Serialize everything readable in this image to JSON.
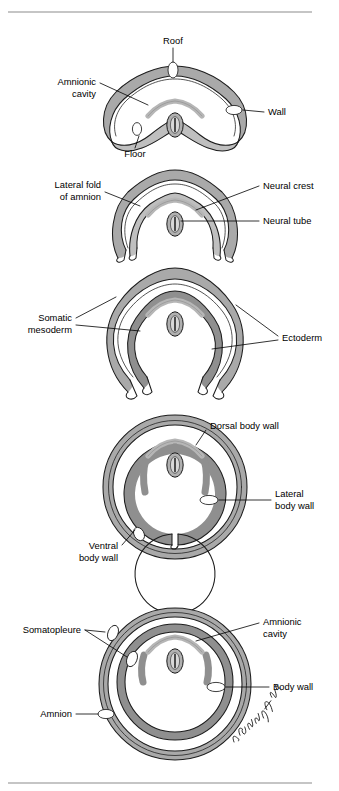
{
  "figure": {
    "rules": {
      "top_y": 12,
      "bottom_y": 783
    },
    "signature": "A. Cunningham '94",
    "palette": {
      "band_gray": "#a9a9a9",
      "band_gray_light": "#bfbfbf",
      "band_dark": "#8f8f8f",
      "outline": "#1c1c1c",
      "cavity": "#ffffff",
      "rule": "#8c8c8c",
      "background": "#ffffff"
    }
  },
  "panels": [
    {
      "id": "panel-1",
      "stage": 1,
      "labels": [
        {
          "id": "roof",
          "text": "Roof",
          "lines": [
            "Roof"
          ],
          "align": "middle",
          "x": 173,
          "y": 44
        },
        {
          "id": "amnionic-cavity",
          "text": "Amnionic cavity",
          "lines": [
            "Amnionic",
            "cavity"
          ],
          "align": "end",
          "x": 96,
          "y": 85
        },
        {
          "id": "wall",
          "text": "Wall",
          "lines": [
            "Wall"
          ],
          "align": "start",
          "x": 268,
          "y": 115
        },
        {
          "id": "floor",
          "text": "Floor",
          "lines": [
            "Floor"
          ],
          "align": "middle",
          "x": 135,
          "y": 155
        }
      ]
    },
    {
      "id": "panel-2",
      "stage": 2,
      "labels": [
        {
          "id": "lateral-fold-of-amnion",
          "text": "Lateral fold of amnion",
          "lines": [
            "Lateral fold",
            "of amnion"
          ],
          "align": "end",
          "x": 101,
          "y": 188
        },
        {
          "id": "neural-crest",
          "text": "Neural crest",
          "lines": [
            "Neural crest"
          ],
          "align": "start",
          "x": 263,
          "y": 188
        },
        {
          "id": "neural-tube",
          "text": "Neural tube",
          "lines": [
            "Neural tube"
          ],
          "align": "start",
          "x": 263,
          "y": 224
        }
      ]
    },
    {
      "id": "panel-3",
      "stage": 3,
      "labels": [
        {
          "id": "somatic-mesoderm",
          "text": "Somatic mesoderm",
          "lines": [
            "Somatic",
            "mesoderm"
          ],
          "align": "end",
          "x": 72,
          "y": 321
        },
        {
          "id": "ectoderm",
          "text": "Ectoderm",
          "lines": [
            "Ectoderm"
          ],
          "align": "start",
          "x": 282,
          "y": 338
        }
      ]
    },
    {
      "id": "panel-4",
      "stage": 4,
      "labels": [
        {
          "id": "dorsal-body-wall",
          "text": "Dorsal body wall",
          "lines": [
            "Dorsal body wall"
          ],
          "align": "start",
          "x": 210,
          "y": 429
        },
        {
          "id": "lateral-body-wall",
          "text": "Lateral body wall",
          "lines": [
            "Lateral",
            "body wall"
          ],
          "align": "start",
          "x": 275,
          "y": 502
        },
        {
          "id": "ventral-body-wall",
          "text": "Ventral body wall",
          "lines": [
            "Ventral",
            "body wall"
          ],
          "align": "end",
          "x": 118,
          "y": 549
        }
      ]
    },
    {
      "id": "panel-5",
      "stage": 5,
      "labels": [
        {
          "id": "somatopleure",
          "text": "Somatopleure",
          "lines": [
            "Somatopleure"
          ],
          "align": "end",
          "x": 81,
          "y": 632
        },
        {
          "id": "amnionic-cavity-2",
          "text": "Amnionic cavity",
          "lines": [
            "Amnionic",
            "cavity"
          ],
          "align": "start",
          "x": 263,
          "y": 625
        },
        {
          "id": "body-wall",
          "text": "Body wall",
          "lines": [
            "Body wall"
          ],
          "align": "start",
          "x": 273,
          "y": 689
        },
        {
          "id": "amnion",
          "text": "Amnion",
          "lines": [
            "Amnion"
          ],
          "align": "end",
          "x": 72,
          "y": 716
        }
      ]
    }
  ],
  "structures": {
    "neural_tube": "oval with slit lumen",
    "neural_crest": "chevron arch above neural tube",
    "amnion_fold": "gray banded fold",
    "somatopleure": "ectoderm plus somatic mesoderm"
  }
}
